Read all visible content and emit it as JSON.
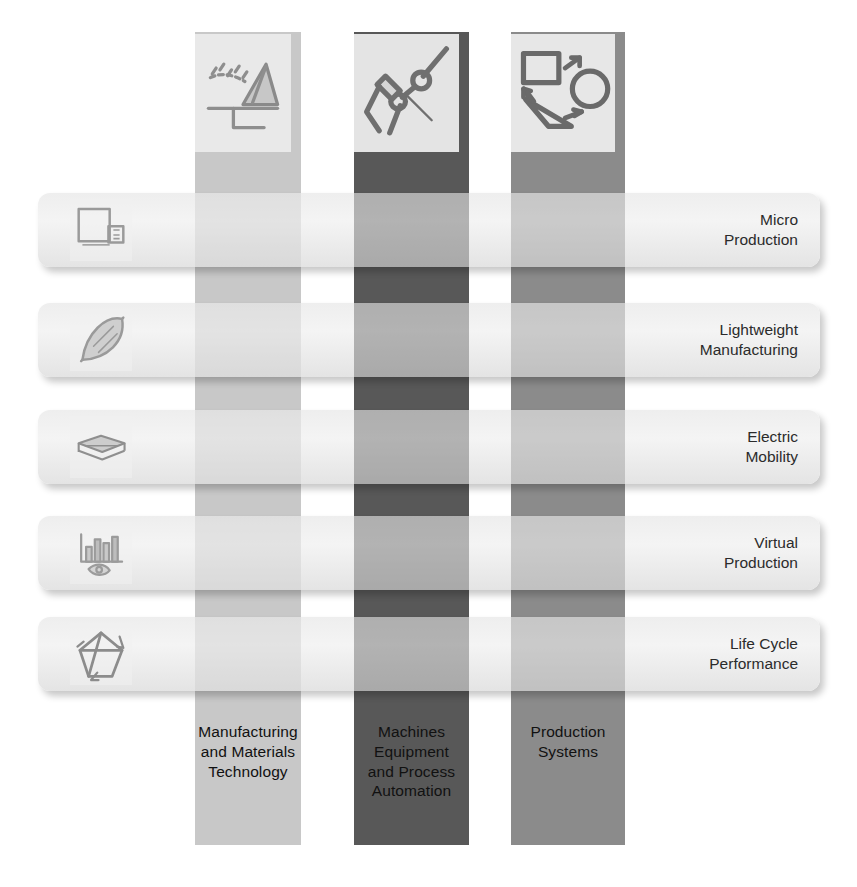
{
  "diagram": {
    "columns": [
      {
        "id": "manufacturing-and-materials-technology",
        "label": "Manufacturing\nand Materials\nTechnology",
        "color": "#c8c8c8",
        "tile_bg": "#e9e9e9",
        "icon": "cutting-tool-icon",
        "x": 195,
        "width": 106,
        "caption_tone": "dark-text"
      },
      {
        "id": "machines-equipment-and-process-automation",
        "label": "Machines\nEquipment\nand Process\nAutomation",
        "color": "#585858",
        "tile_bg": "#e4e4e4",
        "icon": "robot-arm-icon",
        "x": 354,
        "width": 115,
        "caption_tone": "dark-text"
      },
      {
        "id": "production-systems",
        "label": "Production\nSystems",
        "color": "#8b8b8b",
        "tile_bg": "#e7e7e7",
        "icon": "process-flow-shapes-icon",
        "x": 511,
        "width": 114,
        "caption_tone": "dark-text"
      }
    ],
    "rows": [
      {
        "id": "micro-production",
        "label": "Micro\nProduction",
        "icon": "scaling-squares-icon",
        "y": 193
      },
      {
        "id": "lightweight-manufacturing",
        "label": "Lightweight\nManufacturing",
        "icon": "feather-icon",
        "y": 303
      },
      {
        "id": "electric-mobility",
        "label": "Electric\nMobility",
        "icon": "battery-stack-icon",
        "y": 410
      },
      {
        "id": "virtual-production",
        "label": "Virtual\nProduction",
        "icon": "chart-with-hand-icon",
        "y": 516
      },
      {
        "id": "life-cycle-performance",
        "label": "Life Cycle\nPerformance",
        "icon": "cycle-arrows-icon",
        "y": 617
      }
    ],
    "column_caption_top": 722,
    "column_bottom": 845,
    "column_top": 32,
    "tile": {
      "size": 96,
      "top": 34,
      "offset_x": 4
    }
  }
}
